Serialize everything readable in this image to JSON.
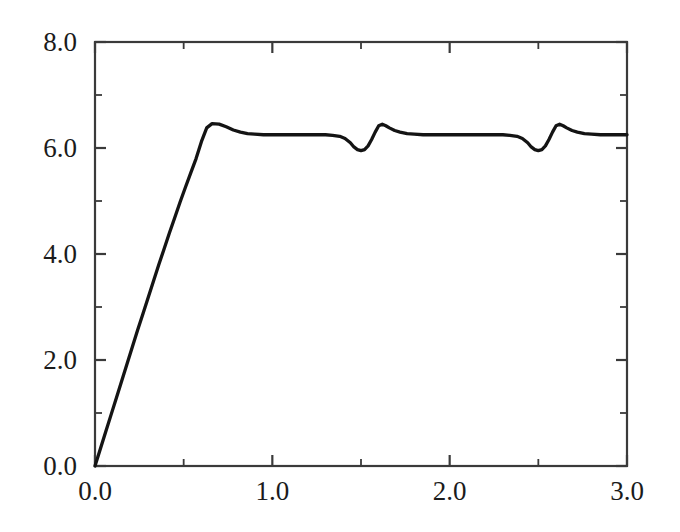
{
  "chart_data": {
    "type": "line",
    "title": "",
    "subtitle": "",
    "xlabel": "",
    "ylabel": "",
    "xlim": [
      0.0,
      3.0
    ],
    "ylim": [
      0.0,
      8.0
    ],
    "grid": false,
    "legend": null,
    "annotations": [],
    "x_major_ticks": [
      0.0,
      1.0,
      2.0,
      3.0
    ],
    "x_major_tick_labels": [
      "0.0",
      "1.0",
      "2.0",
      "3.0"
    ],
    "x_minor_ticks": [
      0.5,
      1.5,
      2.5
    ],
    "y_major_ticks": [
      0.0,
      2.0,
      4.0,
      6.0,
      8.0
    ],
    "y_major_tick_labels": [
      "0.0",
      "2.0",
      "4.0",
      "6.0",
      "8.0"
    ],
    "y_minor_ticks": [
      1.0,
      3.0,
      5.0,
      7.0
    ],
    "line_color": "#141414",
    "frame_color": "#3a3a3a",
    "background_color": "#ffffff",
    "series": [
      {
        "name": "response",
        "x": [
          0.0,
          0.03,
          0.06,
          0.09,
          0.12,
          0.15,
          0.18,
          0.21,
          0.24,
          0.27,
          0.3,
          0.33,
          0.36,
          0.39,
          0.42,
          0.45,
          0.48,
          0.51,
          0.54,
          0.57,
          0.6,
          0.63,
          0.66,
          0.7,
          0.74,
          0.78,
          0.82,
          0.86,
          0.9,
          0.95,
          1.0,
          1.05,
          1.1,
          1.15,
          1.2,
          1.25,
          1.3,
          1.34,
          1.38,
          1.41,
          1.44,
          1.46,
          1.48,
          1.5,
          1.52,
          1.54,
          1.56,
          1.58,
          1.6,
          1.62,
          1.64,
          1.66,
          1.69,
          1.72,
          1.76,
          1.8,
          1.85,
          1.9,
          1.95,
          2.0,
          2.05,
          2.1,
          2.15,
          2.2,
          2.25,
          2.3,
          2.34,
          2.38,
          2.41,
          2.44,
          2.46,
          2.48,
          2.5,
          2.52,
          2.54,
          2.56,
          2.58,
          2.6,
          2.62,
          2.64,
          2.66,
          2.69,
          2.72,
          2.76,
          2.8,
          2.85,
          2.9,
          2.95,
          3.0
        ],
        "y": [
          0.0,
          0.32,
          0.64,
          0.96,
          1.28,
          1.6,
          1.92,
          2.24,
          2.56,
          2.87,
          3.18,
          3.49,
          3.8,
          4.1,
          4.4,
          4.69,
          4.98,
          5.26,
          5.53,
          5.8,
          6.12,
          6.38,
          6.46,
          6.45,
          6.4,
          6.34,
          6.3,
          6.27,
          6.26,
          6.25,
          6.25,
          6.25,
          6.25,
          6.25,
          6.25,
          6.25,
          6.25,
          6.24,
          6.22,
          6.18,
          6.1,
          6.02,
          5.97,
          5.95,
          5.97,
          6.04,
          6.16,
          6.3,
          6.42,
          6.45,
          6.42,
          6.38,
          6.33,
          6.3,
          6.27,
          6.26,
          6.25,
          6.25,
          6.25,
          6.25,
          6.25,
          6.25,
          6.25,
          6.25,
          6.25,
          6.25,
          6.24,
          6.22,
          6.18,
          6.1,
          6.02,
          5.97,
          5.95,
          5.97,
          6.04,
          6.16,
          6.3,
          6.42,
          6.45,
          6.42,
          6.38,
          6.33,
          6.3,
          6.27,
          6.26,
          6.25,
          6.25,
          6.25,
          6.25
        ]
      }
    ]
  }
}
